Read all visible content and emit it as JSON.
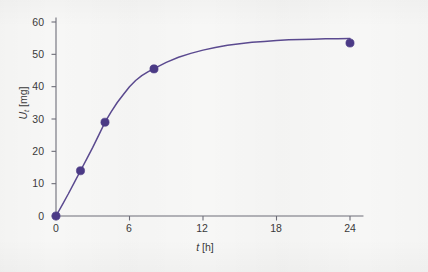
{
  "figure": {
    "background_color": "#f7f7f6",
    "curve_color": "#5b4a90",
    "marker_color": "#4b3a86",
    "axis_color": "#6e6e78"
  },
  "axis_titles": {
    "y_symbol": "U",
    "y_subscript": "t",
    "y_unit": "[mg]",
    "x_symbol": "t",
    "x_unit": "[h]"
  },
  "chart_data": {
    "type": "line",
    "title": "",
    "subtitle": "",
    "xlabel": "t [h]",
    "ylabel": "Ut [mg]",
    "xlim": [
      0,
      26
    ],
    "ylim": [
      0,
      62
    ],
    "xticks": [
      0,
      6,
      12,
      18,
      24
    ],
    "yticks": [
      0,
      10,
      20,
      30,
      40,
      50,
      60
    ],
    "xtick_labels": [
      "0",
      "6",
      "12",
      "18",
      "24"
    ],
    "ytick_labels": [
      "0",
      "10",
      "20",
      "30",
      "40",
      "50",
      "60"
    ],
    "grid": false,
    "legend": "none",
    "series": [
      {
        "name": "Ut",
        "kind": "scatter+fit",
        "marker": "circle",
        "points": [
          {
            "x": 0,
            "y": 0
          },
          {
            "x": 2,
            "y": 14
          },
          {
            "x": 4,
            "y": 29
          },
          {
            "x": 8,
            "y": 45.5
          },
          {
            "x": 24,
            "y": 53.5
          }
        ]
      },
      {
        "name": "fitted curve",
        "kind": "line",
        "model": "saturating exponential",
        "curve": [
          {
            "x": 0,
            "y": 0
          },
          {
            "x": 0.5,
            "y": 3.4
          },
          {
            "x": 1,
            "y": 6.8
          },
          {
            "x": 1.5,
            "y": 10.4
          },
          {
            "x": 2,
            "y": 14
          },
          {
            "x": 2.5,
            "y": 17.6
          },
          {
            "x": 3,
            "y": 21.2
          },
          {
            "x": 3.5,
            "y": 25.1
          },
          {
            "x": 4,
            "y": 29
          },
          {
            "x": 4.5,
            "y": 32.2
          },
          {
            "x": 5,
            "y": 35.1
          },
          {
            "x": 5.5,
            "y": 37.6
          },
          {
            "x": 6,
            "y": 40
          },
          {
            "x": 6.5,
            "y": 41.9
          },
          {
            "x": 7,
            "y": 43.4
          },
          {
            "x": 7.5,
            "y": 44.6
          },
          {
            "x": 8,
            "y": 45.6
          },
          {
            "x": 9,
            "y": 47.5
          },
          {
            "x": 10,
            "y": 49.1
          },
          {
            "x": 11,
            "y": 50.3
          },
          {
            "x": 12,
            "y": 51.3
          },
          {
            "x": 13,
            "y": 52.1
          },
          {
            "x": 14,
            "y": 52.8
          },
          {
            "x": 15,
            "y": 53.3
          },
          {
            "x": 16,
            "y": 53.7
          },
          {
            "x": 17,
            "y": 54.0
          },
          {
            "x": 18,
            "y": 54.3
          },
          {
            "x": 19,
            "y": 54.5
          },
          {
            "x": 20,
            "y": 54.6
          },
          {
            "x": 21,
            "y": 54.7
          },
          {
            "x": 22,
            "y": 54.8
          },
          {
            "x": 23,
            "y": 54.85
          },
          {
            "x": 24,
            "y": 54.9
          }
        ]
      }
    ]
  }
}
